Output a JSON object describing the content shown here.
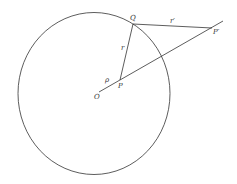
{
  "diagram": {
    "labels": {
      "Q": "Q",
      "r_prime": "r′",
      "P_prime": "P′",
      "r": "r",
      "rho": "ρ",
      "P": "P",
      "O": "O"
    },
    "colors": {
      "stroke": "#333333",
      "background": "#ffffff"
    }
  }
}
